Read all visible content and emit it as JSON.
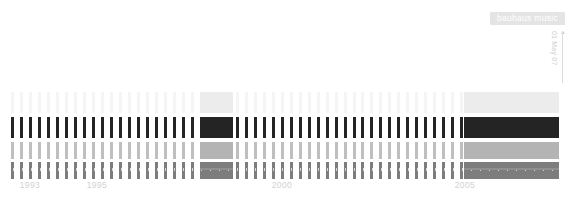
{
  "badge": {
    "label": "bauhaus music"
  },
  "caption": {
    "vertical_date": "01 May 07"
  },
  "axis": {
    "label_years": [
      "1993",
      "1995",
      "2000",
      "2005"
    ],
    "label_x": [
      30,
      97,
      282,
      465
    ],
    "start_year": 1992.0,
    "end_year": 2007.4,
    "tick_step_months": 3,
    "major_years": [
      1993,
      1995,
      2000,
      2005
    ],
    "tick_color": "#d8d8d8",
    "major_color": "#cfcfcf",
    "segment_color": "#8f8f8f"
  },
  "colors": {
    "background": "#ffffff",
    "row1": "#ececec",
    "row2": "#242424",
    "row3": "#b4b4b4",
    "row4": "#7d7d7d",
    "badge_bg": "#e4e4e4",
    "badge_text": "#ffffff",
    "label_text": "#d2d2d2"
  },
  "chart_data": {
    "type": "heatmap",
    "title": "bauhaus music",
    "xlabel": "",
    "ylabel": "",
    "xlim": [
      1992.0,
      2007.4
    ],
    "grid": false,
    "legend": "none",
    "annotations": [
      {
        "text": "bauhaus music",
        "x": 530,
        "y": 18
      },
      {
        "text": "01 May 07",
        "x": 556,
        "y": 55,
        "orientation": "vertical"
      }
    ],
    "x_tick_labels": [
      "1993",
      "1995",
      "2000",
      "2005"
    ],
    "x_tick_values": [
      1993,
      1995,
      2000,
      2005
    ],
    "series": [
      {
        "name": "row-1",
        "color": "#ececec",
        "top": 92,
        "height": 21,
        "tick_opacity": 0.55,
        "blocks": [
          [
            1997.28,
            1998.22
          ],
          [
            2004.65,
            2007.3
          ]
        ]
      },
      {
        "name": "row-2",
        "color": "#242424",
        "top": 117,
        "height": 21,
        "tick_opacity": 1.0,
        "blocks": [
          [
            1997.28,
            1998.22
          ],
          [
            2004.65,
            2007.3
          ]
        ]
      },
      {
        "name": "row-3",
        "color": "#b4b4b4",
        "top": 142,
        "height": 17,
        "tick_opacity": 0.85,
        "blocks": [
          [
            1997.28,
            1998.22
          ],
          [
            2004.65,
            2007.3
          ]
        ]
      },
      {
        "name": "row-4",
        "color": "#7d7d7d",
        "top": 162,
        "height": 17,
        "tick_opacity": 1.0,
        "blocks": [
          [
            1997.28,
            1998.22
          ],
          [
            2004.65,
            2007.3
          ]
        ]
      }
    ],
    "tick_interval_months": 3,
    "tick_start": 1992.08,
    "tick_end": 2007.3,
    "axis_y": 168,
    "labels_y": 180
  }
}
